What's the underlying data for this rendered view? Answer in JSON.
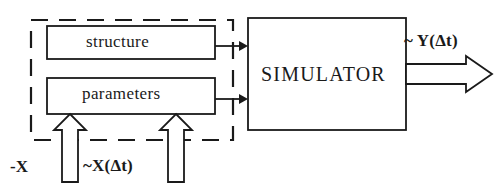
{
  "diagram": {
    "background_color": "#ffffff",
    "stroke_color": "#1a1a1a",
    "model_group": {
      "name": "model-group",
      "border_style": "dashed",
      "boxes": [
        {
          "id": "structure",
          "label": "structure"
        },
        {
          "id": "parameters",
          "label": "parameters"
        }
      ]
    },
    "simulator": {
      "id": "simulator",
      "label": "SIMULATOR"
    },
    "signals": [
      {
        "id": "x-input",
        "label": "-X",
        "direction": "up",
        "target": "parameters"
      },
      {
        "id": "x-delta",
        "label": "~X(Δt)",
        "direction": "up",
        "target": "parameters"
      },
      {
        "id": "y-delta",
        "label": "~ Y(Δt)",
        "direction": "right",
        "source": "simulator"
      }
    ],
    "connectors": [
      {
        "id": "structure-to-simulator",
        "from": "structure",
        "to": "simulator",
        "style": "thin-arrow"
      },
      {
        "id": "parameters-to-simulator",
        "from": "parameters",
        "to": "simulator",
        "style": "thin-arrow"
      }
    ]
  }
}
